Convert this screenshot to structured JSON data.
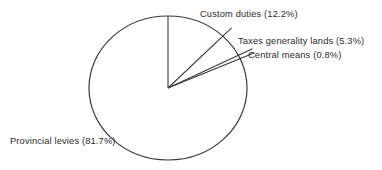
{
  "chart_data": {
    "type": "pie",
    "title": "",
    "categories": [
      "Custom duties",
      "Taxes generality lands",
      "Central means",
      "Provincial levies"
    ],
    "values": [
      12.2,
      5.3,
      0.8,
      81.7
    ],
    "units": "%",
    "start_angle_deg": 0,
    "direction": "clockwise",
    "legend": "none",
    "grid": false,
    "labels": [
      {
        "text": "Custom duties (12.2%)",
        "category": "Custom duties",
        "value": 12.2
      },
      {
        "text": "Taxes generality lands (5.3%)",
        "category": "Taxes generality lands",
        "value": 5.3
      },
      {
        "text": "Central means (0.8%)",
        "category": "Central means",
        "value": 0.8
      },
      {
        "text": "Provincial levies (81.7%)",
        "category": "Provincial levies",
        "value": 81.7
      }
    ],
    "colors": {
      "stroke": "#3a3a3a",
      "fill": "#ffffff",
      "text": "#2b2b2b",
      "background": "#ffffff"
    },
    "geometry": {
      "center_x": 168,
      "center_y": 88,
      "radius_x": 79,
      "radius_y": 72
    }
  }
}
